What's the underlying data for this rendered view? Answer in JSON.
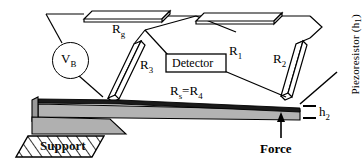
{
  "figure": {
    "type": "piezoresistive-cantilever-force-sensor-schematic",
    "labels": {
      "rg": "R",
      "rg_sub": "g",
      "r1": "R",
      "r1_sub": "1",
      "r2": "R",
      "r2_sub": "2",
      "r3": "R",
      "r3_sub": "3",
      "rs_r4_prefix": "R",
      "rs_r4_sub1": "s",
      "rs_r4_mid": "=R",
      "rs_r4_sub2": "4",
      "vb": "V",
      "vb_sub": "B",
      "detector": "Detector",
      "support": "Support",
      "force": "Force",
      "h2": "h",
      "h2_sub": "2",
      "piezoresistor": "Piezoresistor (h",
      "piezoresistor_sub": "1",
      "piezoresistor_tail": ")"
    },
    "colors": {
      "stroke": "#000000",
      "background": "#ffffff",
      "beam_body": "#b3b3b3",
      "beam_top_layer": "#1a1a1a",
      "support_block": "#b0b0b0",
      "hatch": "#000000"
    }
  }
}
